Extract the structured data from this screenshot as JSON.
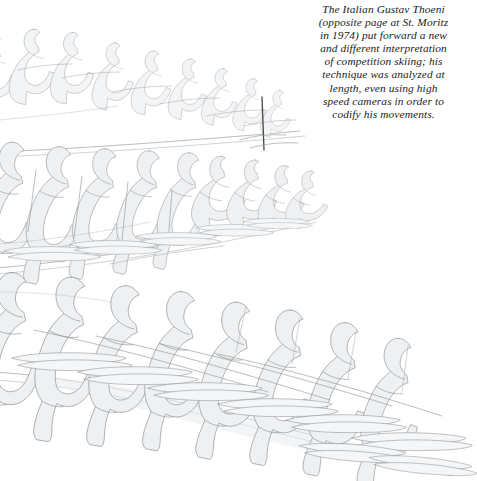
{
  "page": {
    "background_color": "#ffffff",
    "kind": "book-page-illustration"
  },
  "caption": {
    "text": "The Italian Gustav Thoeni\n(opposite page at St. Moritz\nin 1974) put forward a new\nand different interpretation\nof competition skiing; his\ntechnique was analyzed at\nlength, even using high\nspeed cameras in order to\ncodify his movements.",
    "alignment": "center",
    "style": "italic-serif",
    "color": "#1b1b1b"
  },
  "artwork": {
    "title": "Sequential motion study of a competition skier",
    "subject": "Gustav Thoeni slalom sequence",
    "technique": "line drawing with light grey wash",
    "outline_color": "#8d9094",
    "fill_color": "#eef0f2",
    "shadow_color": "#e3e6e8",
    "pole_color": "#4a4a4a",
    "bands": [
      {
        "name": "upper-band",
        "figure_count": 9,
        "direction": "left-to-right descending",
        "note": "uppermost row of overlapping skier silhouettes"
      },
      {
        "name": "middle-band",
        "figure_count": 9,
        "direction": "left-to-right descending",
        "note": "middle row with ski poles and slope line"
      },
      {
        "name": "lower-band",
        "figure_count": 8,
        "direction": "left-to-right descending",
        "note": "largest foreground row with skis and long shadows"
      }
    ],
    "slope_lines": 3,
    "vertical_pole": {
      "name": "upright-ski-pole",
      "x": 262,
      "y_top": 97,
      "y_bottom": 150
    }
  }
}
